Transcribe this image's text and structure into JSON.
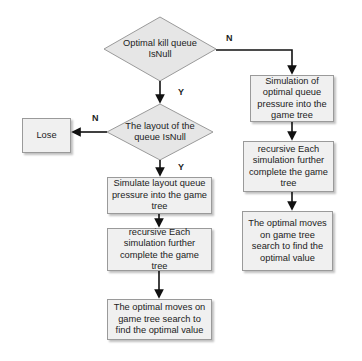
{
  "diagram": {
    "type": "flowchart",
    "nodes": {
      "decision_kill_queue": "Optimal kill queue IsNull",
      "decision_layout_queue": "The layout of the queue  IsNull",
      "lose": "Lose",
      "left_simulate": "Simulate layout queue pressure into the game tree",
      "left_recursive": "recursive Each simulation further complete the game tree",
      "left_optimal": "The optimal moves on game tree search to find the optimal value",
      "right_simulate": "Simulation of optimal queue pressure into the game tree",
      "right_recursive": "recursive Each simulation further complete the game tree",
      "right_optimal": "The optimal moves on game tree search to find the optimal value"
    },
    "edge_labels": {
      "kill_no": "N",
      "kill_yes": "Y",
      "layout_no": "N",
      "layout_yes": "Y"
    },
    "colors": {
      "box_fill": "#f0f0f0",
      "diamond_fill": "#e6e6e6",
      "stroke": "#9a9a9a",
      "arrow": "#111111"
    }
  }
}
